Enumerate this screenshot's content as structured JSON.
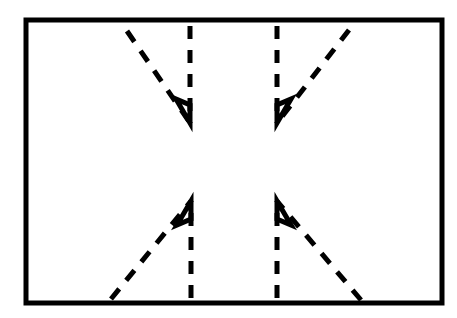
{
  "figure": {
    "canvas": {
      "width": 457,
      "height": 318,
      "background": "#ffffff"
    },
    "stroke_color": "#000000",
    "frame": {
      "name": "outer-border-rectangle",
      "x": 26,
      "y": 20,
      "width": 416,
      "height": 283,
      "stroke_width": 5,
      "fill": "none",
      "color": "#000000"
    },
    "line_style": {
      "dash_length": 13,
      "gap_length": 11,
      "stroke_width": 5,
      "linecap": "butt"
    },
    "arrows": [
      {
        "id": "arrow-top-left",
        "label": "Top-left arrow",
        "direction": "down",
        "tip": {
          "x": 190,
          "y": 123
        },
        "shaft": {
          "x1": 190,
          "y1": 26,
          "x2": 190,
          "y2": 123
        },
        "diagonal": {
          "x1": 127,
          "y1": 31,
          "x2": 190,
          "y2": 123
        }
      },
      {
        "id": "arrow-top-right",
        "label": "Top-right arrow",
        "direction": "down",
        "tip": {
          "x": 277,
          "y": 123
        },
        "shaft": {
          "x1": 277,
          "y1": 26,
          "x2": 277,
          "y2": 123
        },
        "diagonal": {
          "x1": 349,
          "y1": 30,
          "x2": 277,
          "y2": 123
        }
      },
      {
        "id": "arrow-bottom-left",
        "label": "Bottom-left arrow",
        "direction": "up",
        "tip": {
          "x": 191,
          "y": 201
        },
        "shaft": {
          "x1": 191,
          "y1": 298,
          "x2": 191,
          "y2": 201
        },
        "diagonal": {
          "x1": 111,
          "y1": 299,
          "x2": 191,
          "y2": 201
        }
      },
      {
        "id": "arrow-bottom-right",
        "label": "Bottom-right arrow",
        "direction": "up",
        "tip": {
          "x": 277,
          "y": 201
        },
        "shaft": {
          "x1": 277,
          "y1": 298,
          "x2": 277,
          "y2": 201
        },
        "diagonal": {
          "x1": 361,
          "y1": 300,
          "x2": 277,
          "y2": 201
        }
      }
    ],
    "arrowheads": [
      {
        "id": "head-top-left",
        "belongs_to": "arrow-top-left",
        "points": "176,99 190,123 190,105"
      },
      {
        "id": "head-top-right",
        "belongs_to": "arrow-top-right",
        "points": "277,105 277,123 291,99"
      },
      {
        "id": "head-bottom-left",
        "belongs_to": "arrow-bottom-left",
        "points": "177,225 191,201 191,219"
      },
      {
        "id": "head-bottom-right",
        "belongs_to": "arrow-bottom-right",
        "points": "277,219 277,201 291,225"
      }
    ]
  }
}
